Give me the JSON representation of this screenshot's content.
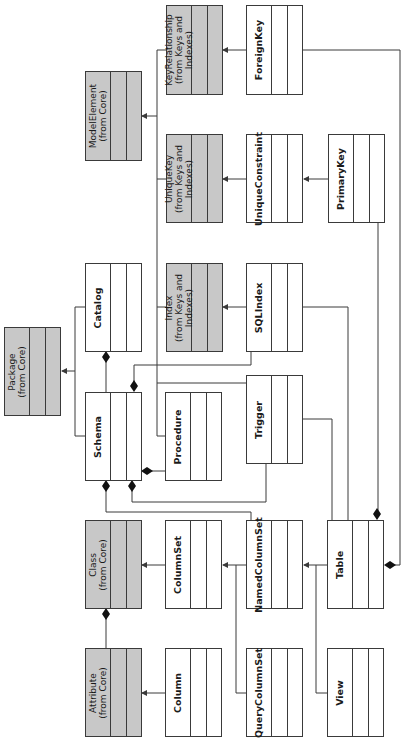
{
  "diagram": {
    "orientation": "rotated-90-ccw",
    "colors": {
      "core_fill": "#c8c8c8",
      "class_fill": "#ffffff",
      "line": "#3a3a3a"
    },
    "classes": {
      "foreign_key": {
        "label": "ForeignKey"
      },
      "key_relationship": {
        "label": "KeyRelationship\n(from Keys and\nIndexes)"
      },
      "model_element": {
        "label": "ModelElement\n(from Core)"
      },
      "unique_key": {
        "label": "UniqueKey\n(from Keys and\nIndexes)"
      },
      "unique_constraint": {
        "label": "UniqueConstraint"
      },
      "primary_key": {
        "label": "PrimaryKey"
      },
      "package": {
        "label": "Package\n(from Core)"
      },
      "catalog": {
        "label": "Catalog"
      },
      "index": {
        "label": "Index\n(from Keys and\nIndexes)"
      },
      "sql_index": {
        "label": "SQLIndex"
      },
      "schema": {
        "label": "Schema"
      },
      "procedure": {
        "label": "Procedure"
      },
      "trigger": {
        "label": "Trigger"
      },
      "class": {
        "label": "Class\n(from Core)"
      },
      "column_set": {
        "label": "ColumnSet"
      },
      "named_column_set": {
        "label": "NamedColumnSet"
      },
      "table": {
        "label": "Table"
      },
      "attribute": {
        "label": "Attribute\n(from Core)"
      },
      "column": {
        "label": "Column"
      },
      "query_column_set": {
        "label": "QueryColumnSet"
      },
      "view": {
        "label": "View"
      }
    },
    "relationships": [
      {
        "type": "generalization",
        "from": "ForeignKey",
        "to": "KeyRelationship"
      },
      {
        "type": "generalization",
        "from": "KeyRelationship",
        "to": "ModelElement"
      },
      {
        "type": "generalization",
        "from": "UniqueKey",
        "to": "ModelElement"
      },
      {
        "type": "generalization",
        "from": "Index",
        "to": "ModelElement"
      },
      {
        "type": "generalization",
        "from": "Procedure",
        "to": "ModelElement"
      },
      {
        "type": "generalization",
        "from": "Trigger",
        "to": "ModelElement"
      },
      {
        "type": "generalization",
        "from": "UniqueConstraint",
        "to": "UniqueKey"
      },
      {
        "type": "generalization",
        "from": "PrimaryKey",
        "to": "UniqueConstraint"
      },
      {
        "type": "generalization",
        "from": "SQLIndex",
        "to": "Index"
      },
      {
        "type": "generalization",
        "from": "Catalog",
        "to": "Package"
      },
      {
        "type": "generalization",
        "from": "Schema",
        "to": "Package"
      },
      {
        "type": "composition",
        "whole": "Catalog",
        "part": "Schema"
      },
      {
        "type": "composition",
        "whole": "Schema",
        "part": "SQLIndex"
      },
      {
        "type": "composition",
        "whole": "Schema",
        "part": "Procedure"
      },
      {
        "type": "composition",
        "whole": "Schema",
        "part": "NamedColumnSet"
      },
      {
        "type": "composition",
        "whole": "Schema",
        "part": "Trigger"
      },
      {
        "type": "generalization",
        "from": "ColumnSet",
        "to": "Class"
      },
      {
        "type": "generalization",
        "from": "NamedColumnSet",
        "to": "ColumnSet"
      },
      {
        "type": "generalization",
        "from": "QueryColumnSet",
        "to": "ColumnSet"
      },
      {
        "type": "generalization",
        "from": "Table",
        "to": "NamedColumnSet"
      },
      {
        "type": "generalization",
        "from": "View",
        "to": "NamedColumnSet"
      },
      {
        "type": "composition",
        "whole": "Table",
        "part": "PrimaryKey"
      },
      {
        "type": "composition",
        "whole": "Table",
        "part": "ForeignKey"
      },
      {
        "type": "association",
        "from": "Table",
        "to": "Trigger"
      },
      {
        "type": "association",
        "from": "Table",
        "to": "SQLIndex"
      },
      {
        "type": "composition",
        "whole": "Class",
        "part": "Attribute"
      },
      {
        "type": "generalization",
        "from": "Column",
        "to": "Attribute"
      }
    ]
  }
}
